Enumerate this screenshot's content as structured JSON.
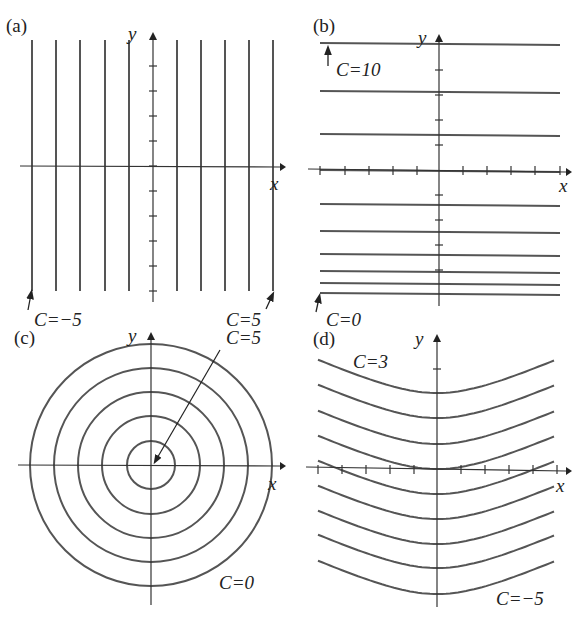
{
  "panels": {
    "a": {
      "label": "(a)",
      "x_axis": "x",
      "y_axis": "y",
      "annotations": [
        {
          "text": "C=−5"
        },
        {
          "text": "C=5"
        }
      ],
      "lines_x": [
        32,
        56,
        80,
        105,
        129,
        177,
        201,
        225,
        249,
        273
      ]
    },
    "b": {
      "label": "(b)",
      "x_axis": "x",
      "y_axis": "y",
      "annotations": [
        {
          "text": "C=10"
        },
        {
          "text": "C=0"
        }
      ],
      "lines_y": [
        43,
        91,
        134,
        170,
        204,
        231,
        254,
        271,
        283,
        293
      ]
    },
    "c": {
      "label": "(c)",
      "x_axis": "x",
      "y_axis": "y",
      "annotations": [
        {
          "text": "C=5"
        },
        {
          "text": "C=0"
        }
      ],
      "radii": [
        24,
        49,
        73,
        97,
        121
      ]
    },
    "d": {
      "label": "(d)",
      "x_axis": "x",
      "y_axis": "y",
      "annotations": [
        {
          "text": "C=3"
        },
        {
          "text": "C=−5"
        }
      ],
      "vertex_y": [
        393,
        418,
        444,
        469,
        494,
        519,
        544,
        568,
        594
      ]
    }
  },
  "chart_data": [
    {
      "type": "line",
      "title": "(a) level curves: vertical lines x = C",
      "xlabel": "x",
      "ylabel": "y",
      "levels": [
        -5,
        -4,
        -3,
        -2,
        -1,
        0,
        1,
        2,
        3,
        4,
        5
      ],
      "annotations": [
        "C=−5",
        "C=5"
      ]
    },
    {
      "type": "line",
      "title": "(b) level curves: horizontal lines",
      "xlabel": "x",
      "ylabel": "y",
      "levels": [
        0,
        1,
        2,
        3,
        4,
        5,
        6,
        7,
        8,
        9,
        10
      ],
      "annotations": [
        "C=10",
        "C=0"
      ]
    },
    {
      "type": "line",
      "title": "(c) level curves: concentric circles",
      "xlabel": "x",
      "ylabel": "y",
      "levels": [
        0,
        1,
        2,
        3,
        4,
        5
      ],
      "annotations": [
        "C=5",
        "C=0"
      ]
    },
    {
      "type": "line",
      "title": "(d) level curves: parabola-like curves",
      "xlabel": "x",
      "ylabel": "y",
      "levels": [
        3,
        2,
        1,
        0,
        -1,
        -2,
        -3,
        -4,
        -5
      ],
      "annotations": [
        "C=3",
        "C=−5"
      ]
    }
  ]
}
